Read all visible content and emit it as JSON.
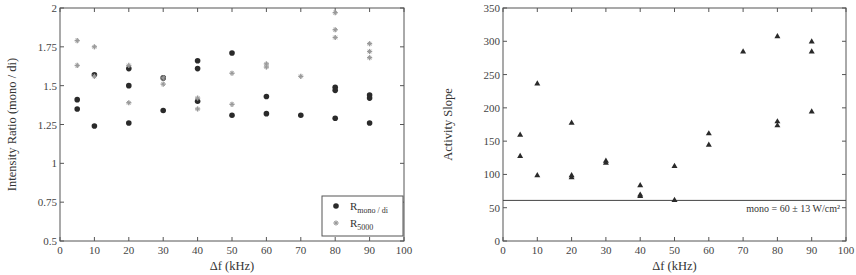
{
  "chart_data": [
    {
      "type": "scatter",
      "title": "",
      "xlabel": "Δf (kHz)",
      "ylabel": "Intensity Ratio (mono / di)",
      "xlim": [
        0,
        100
      ],
      "ylim": [
        0.5,
        2
      ],
      "xticks": [
        0,
        10,
        20,
        30,
        40,
        50,
        60,
        70,
        80,
        90,
        100
      ],
      "yticks": [
        0.5,
        0.75,
        1,
        1.25,
        1.5,
        1.75,
        2
      ],
      "ytick_labels": [
        "0.5",
        "0.75",
        "1",
        "1.25",
        "1.5",
        "1.75",
        "2"
      ],
      "grid": false,
      "legend_position": "lower right",
      "series": [
        {
          "name": "R_mono/di",
          "label_main": "R",
          "label_sub": "mono / di",
          "marker": "circle",
          "color": "#2a2a2a",
          "points": [
            [
              5,
              1.41
            ],
            [
              5,
              1.35
            ],
            [
              10,
              1.24
            ],
            [
              10,
              1.57
            ],
            [
              20,
              1.61
            ],
            [
              20,
              1.5
            ],
            [
              20,
              1.26
            ],
            [
              30,
              1.55
            ],
            [
              30,
              1.34
            ],
            [
              40,
              1.66
            ],
            [
              40,
              1.61
            ],
            [
              40,
              1.4
            ],
            [
              50,
              1.71
            ],
            [
              50,
              1.31
            ],
            [
              60,
              1.43
            ],
            [
              60,
              1.32
            ],
            [
              70,
              1.31
            ],
            [
              80,
              1.49
            ],
            [
              80,
              1.47
            ],
            [
              80,
              1.29
            ],
            [
              90,
              1.44
            ],
            [
              90,
              1.42
            ],
            [
              90,
              1.26
            ]
          ]
        },
        {
          "name": "R_5000",
          "label_main": "R",
          "label_sub": "5000",
          "marker": "star",
          "color": "#9a9a9a",
          "points": [
            [
              5,
              1.79
            ],
            [
              5,
              1.63
            ],
            [
              10,
              1.75
            ],
            [
              10,
              1.56
            ],
            [
              20,
              1.63
            ],
            [
              20,
              1.39
            ],
            [
              30,
              1.55
            ],
            [
              30,
              1.51
            ],
            [
              40,
              1.42
            ],
            [
              40,
              1.35
            ],
            [
              50,
              1.58
            ],
            [
              50,
              1.38
            ],
            [
              60,
              1.64
            ],
            [
              60,
              1.62
            ],
            [
              70,
              1.56
            ],
            [
              80,
              1.97
            ],
            [
              80,
              1.86
            ],
            [
              80,
              1.81
            ],
            [
              90,
              1.77
            ],
            [
              90,
              1.72
            ],
            [
              90,
              1.68
            ]
          ]
        }
      ]
    },
    {
      "type": "scatter",
      "title": "",
      "xlabel": "Δf (kHz)",
      "ylabel": "Activity Slope",
      "xlim": [
        0,
        100
      ],
      "ylim": [
        0,
        350
      ],
      "xticks": [
        0,
        10,
        20,
        30,
        40,
        50,
        60,
        70,
        80,
        90,
        100
      ],
      "yticks": [
        0,
        50,
        100,
        150,
        200,
        250,
        300,
        350
      ],
      "ytick_labels": [
        "0",
        "50",
        "100",
        "150",
        "200",
        "250",
        "300",
        "350"
      ],
      "grid": false,
      "series": [
        {
          "name": "Activity Slope",
          "marker": "triangle",
          "color": "#2a2a2a",
          "points": [
            [
              5,
              160
            ],
            [
              5,
              128
            ],
            [
              10,
              237
            ],
            [
              10,
              99
            ],
            [
              20,
              178
            ],
            [
              20,
              99
            ],
            [
              20,
              96
            ],
            [
              30,
              121
            ],
            [
              30,
              118
            ],
            [
              40,
              84
            ],
            [
              40,
              70
            ],
            [
              40,
              68
            ],
            [
              50,
              113
            ],
            [
              50,
              62
            ],
            [
              60,
              162
            ],
            [
              60,
              145
            ],
            [
              70,
              285
            ],
            [
              80,
              308
            ],
            [
              80,
              180
            ],
            [
              80,
              174
            ],
            [
              90,
              300
            ],
            [
              90,
              285
            ],
            [
              90,
              195
            ]
          ]
        }
      ],
      "reference_line": {
        "y": 61,
        "label": "mono = 60  ± 13 W/cm²"
      }
    }
  ]
}
